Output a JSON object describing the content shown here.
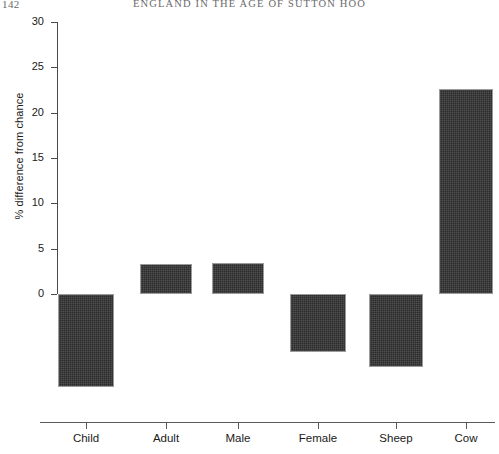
{
  "page": {
    "folio": "142",
    "running_title": "ENGLAND IN THE AGE OF SUTTON HOO"
  },
  "chart_data": {
    "type": "bar",
    "title": "",
    "subtitle": "",
    "xlabel": "",
    "ylabel": "% difference from chance",
    "categories": [
      "Child",
      "Adult",
      "Male",
      "Female",
      "Sheep",
      "Cow"
    ],
    "values": [
      -10.3,
      3.3,
      3.4,
      -6.4,
      -8.1,
      22.6
    ],
    "ylim": [
      -12,
      30
    ],
    "yticks": [
      0,
      5,
      10,
      15,
      20,
      25,
      30
    ],
    "ytick_labels": [
      "0",
      "5",
      "10",
      "15",
      "20",
      "25",
      "30"
    ],
    "grid": false,
    "legend": null,
    "legend_position": "none",
    "bar_color": "#2b2b2b",
    "bar_edge_color": "#9b9b9b",
    "axis_color": "#4a4a4a",
    "baseline_value": 0,
    "annotations": []
  }
}
